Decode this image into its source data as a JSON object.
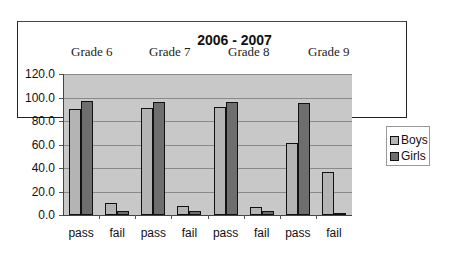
{
  "chart_data": {
    "type": "bar",
    "title": "2006 - 2007",
    "groups": [
      "Grade 6",
      "Grade 7",
      "Grade 8",
      "Grade 9"
    ],
    "categories": [
      "pass",
      "fail",
      "pass",
      "fail",
      "pass",
      "fail",
      "pass",
      "fail"
    ],
    "series": [
      {
        "name": "Boys",
        "color": "#b4b4b4",
        "values": [
          90,
          10,
          91,
          8,
          92,
          7,
          61,
          37
        ]
      },
      {
        "name": "Girls",
        "color": "#6e6e6e",
        "values": [
          97,
          3,
          96,
          3,
          96,
          3,
          95,
          2
        ]
      }
    ],
    "xlabel": "",
    "ylabel": "",
    "ylim": [
      0,
      120
    ],
    "yticks": [
      "0.0",
      "20.0",
      "40.0",
      "60.0",
      "80.0",
      "100.0",
      "120.0"
    ],
    "grid": true,
    "legend_position": "right"
  },
  "legend": {
    "boys": "Boys",
    "girls": "Girls"
  }
}
